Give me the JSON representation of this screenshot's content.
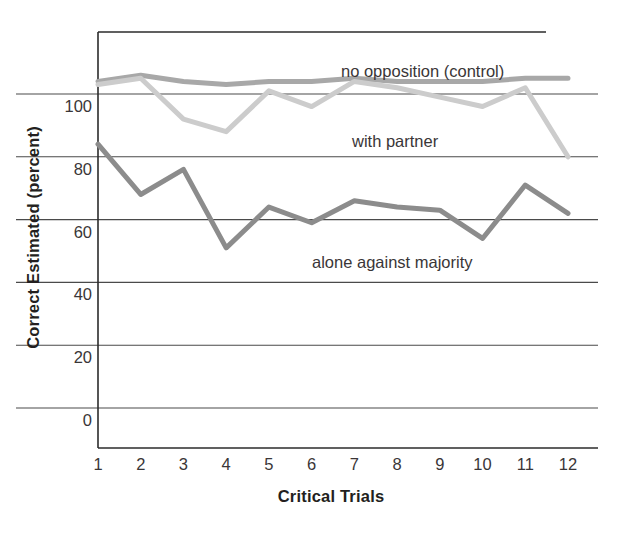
{
  "chart_data": {
    "type": "line",
    "title": "",
    "xlabel": "Critical Trials",
    "ylabel": "Correct Estimated (percent)",
    "x": [
      1,
      2,
      3,
      4,
      5,
      6,
      7,
      8,
      9,
      10,
      11,
      12
    ],
    "categories": [
      "1",
      "2",
      "3",
      "4",
      "5",
      "6",
      "7",
      "8",
      "9",
      "10",
      "11",
      "12"
    ],
    "xlim": [
      0.65,
      12.35
    ],
    "ylim": [
      -13,
      123
    ],
    "yticks": [
      0,
      20,
      40,
      60,
      80,
      100
    ],
    "ytick_labels": [
      "0",
      "20",
      "40",
      "60",
      "80",
      "100"
    ],
    "grid": "horizontal",
    "grid_extends_past_axis": true,
    "legend": "inline-annotations",
    "series": [
      {
        "name": "no opposition (control)",
        "color": "#a8a8a8",
        "values": [
          104,
          106,
          104,
          103,
          104,
          104,
          105,
          104,
          104,
          104,
          105,
          105
        ]
      },
      {
        "name": "with partner",
        "color": "#cccccc",
        "values": [
          103,
          105,
          92,
          88,
          101,
          96,
          104,
          102,
          99,
          96,
          102,
          80
        ]
      },
      {
        "name": "alone against majority",
        "color": "#8c8c8c",
        "values": [
          84,
          68,
          76,
          51,
          64,
          59,
          66,
          64,
          63,
          54,
          71,
          62
        ]
      }
    ],
    "annotations": [
      {
        "text": "no opposition (control)",
        "x_px": 341,
        "y_px": 62
      },
      {
        "text": "with partner",
        "x_px": 352,
        "y_px": 132
      },
      {
        "text": "alone against majority",
        "x_px": 312,
        "y_px": 253
      }
    ]
  }
}
